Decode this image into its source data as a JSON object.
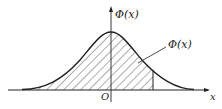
{
  "diagram": {
    "type": "normal-distribution-cdf-area",
    "y_axis_label": "Φ(x)",
    "area_label": "Φ(x)",
    "origin_label": "O",
    "x_axis_label": "x",
    "colors": {
      "stroke": "#222222",
      "hatch": "#333333",
      "background": "#ffffff"
    }
  }
}
